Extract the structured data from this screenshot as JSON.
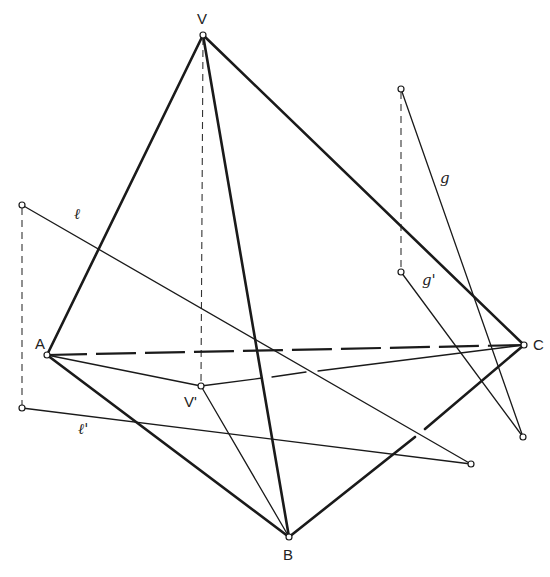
{
  "diagram": {
    "labels": {
      "V": "V",
      "A": "A",
      "B": "B",
      "C": "C",
      "V_prime": "V'",
      "l": "ℓ",
      "l_prime": "ℓ'",
      "g": "g",
      "g_prime": "g'"
    },
    "points": {
      "V": [
        203,
        35
      ],
      "A": [
        47,
        355
      ],
      "B": [
        289,
        537
      ],
      "C": [
        524,
        345
      ],
      "V_prime": [
        201,
        386
      ],
      "l_start": [
        22,
        205
      ],
      "l_prime_start": [
        22,
        408
      ],
      "l_end": [
        471,
        464
      ],
      "g_start": [
        401,
        89
      ],
      "g_prime_start": [
        401,
        272
      ],
      "g_end": [
        523,
        437
      ]
    }
  }
}
